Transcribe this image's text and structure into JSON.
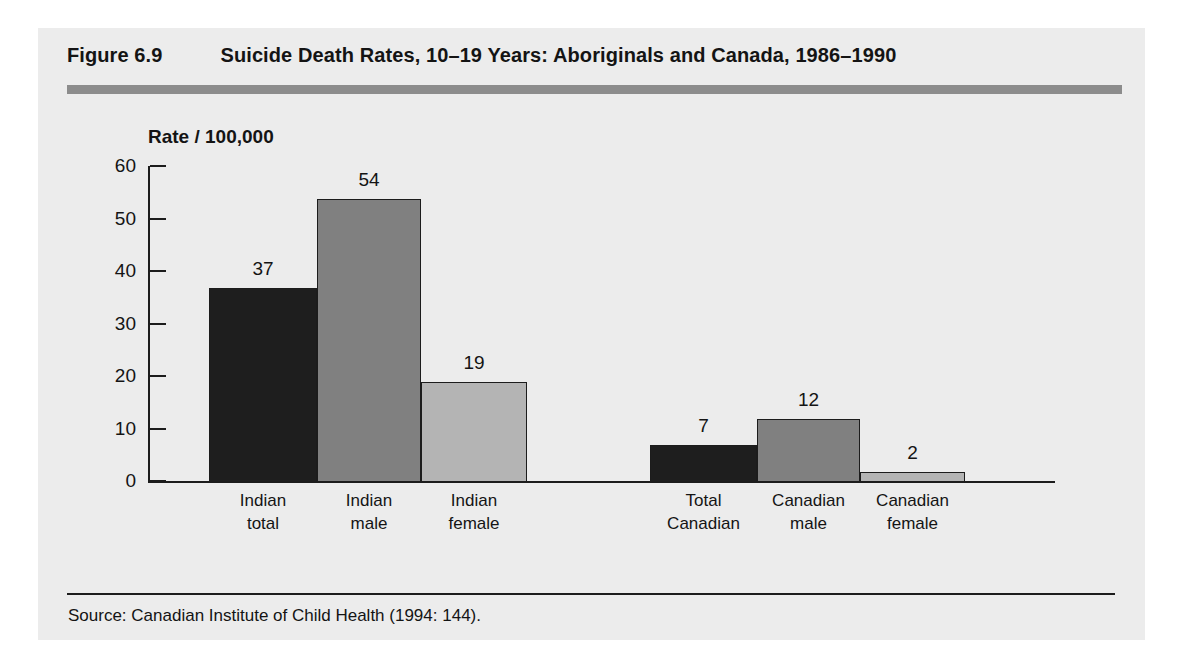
{
  "figure": {
    "number": "Figure 6.9",
    "title": "Suicide Death Rates, 10–19 Years: Aboriginals and Canada, 1986–1990",
    "source": "Source:  Canadian Institute of Child Health (1994: 144)."
  },
  "colors": {
    "panel_background": "#ececec",
    "page_background": "#ffffff",
    "rule": "#8c8c8c",
    "axis": "#1c1c1c",
    "text": "#141414",
    "bar_dark": "#1e1e1e",
    "bar_medium": "#808080",
    "bar_light": "#b4b4b4"
  },
  "chart_data": {
    "type": "bar",
    "title": "Suicide Death Rates, 10–19 Years: Aboriginals and Canada, 1986–1990",
    "xlabel": "",
    "ylabel": "Rate / 100,000",
    "ylim": [
      0,
      60
    ],
    "yticks": [
      0,
      10,
      20,
      30,
      40,
      50,
      60
    ],
    "ytick_labels": [
      "0",
      "10",
      "20",
      "30",
      "40",
      "50",
      "60"
    ],
    "grid": false,
    "legend": false,
    "categories": [
      "Indian total",
      "Indian male",
      "Indian female",
      "Total Canadian",
      "Canadian male",
      "Canadian female"
    ],
    "values": [
      37,
      54,
      19,
      7,
      12,
      2
    ],
    "value_labels": [
      "37",
      "54",
      "19",
      "7",
      "12",
      "2"
    ],
    "groups": [
      {
        "name": "Aboriginals",
        "categories": [
          "Indian total",
          "Indian male",
          "Indian female"
        ]
      },
      {
        "name": "Canada",
        "categories": [
          "Total Canadian",
          "Canadian male",
          "Canadian female"
        ]
      }
    ],
    "bars": [
      {
        "label_line1": "Indian",
        "label_line2": "total",
        "value": 37,
        "value_label": "37",
        "shade": "dark"
      },
      {
        "label_line1": "Indian",
        "label_line2": "male",
        "value": 54,
        "value_label": "54",
        "shade": "medium"
      },
      {
        "label_line1": "Indian",
        "label_line2": "female",
        "value": 19,
        "value_label": "19",
        "shade": "light"
      },
      {
        "label_line1": "Total",
        "label_line2": "Canadian",
        "value": 7,
        "value_label": "7",
        "shade": "dark"
      },
      {
        "label_line1": "Canadian",
        "label_line2": "male",
        "value": 12,
        "value_label": "12",
        "shade": "medium"
      },
      {
        "label_line1": "Canadian",
        "label_line2": "female",
        "value": 2,
        "value_label": "2",
        "shade": "light"
      }
    ]
  }
}
